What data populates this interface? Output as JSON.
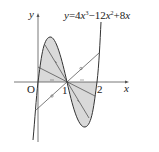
{
  "equation": {
    "y": "y",
    "eq": "=4",
    "x1": "x",
    "exp3": "3",
    "minus": "−12",
    "x2": "x",
    "exp2": "2",
    "plus": "+8",
    "x3": "x"
  },
  "axes": {
    "x_label": "x",
    "y_label": "y",
    "origin_label": "O"
  },
  "ticks": {
    "one": "1",
    "two": "2"
  },
  "colors": {
    "stroke": "#333333",
    "fill": "#d9d9d9",
    "axis": "#555555"
  }
}
